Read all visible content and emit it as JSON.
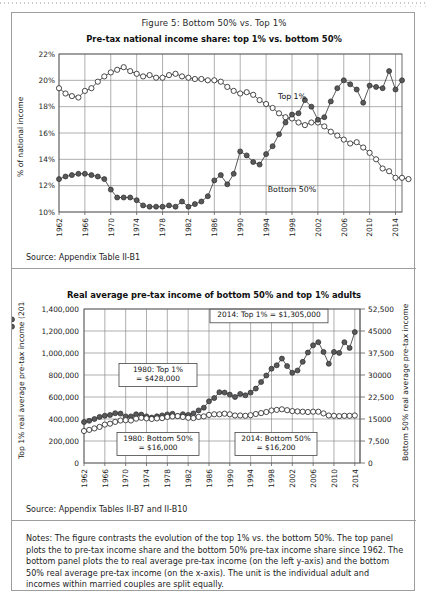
{
  "figure": {
    "caption": "Figure 5: Bottom 50% vs. Top 1%",
    "notes": "Notes: The figure contrasts the evolution of the top 1% vs. the bottom 50%. The top panel plots the to pre-tax income share and the bottom 50% pre-tax income share since 1962. The bottom panel plots the to real average pre-tax income (on the left y-axis) and the bottom 50% real average pre-tax income (on the x-axis). The unit is the individual adult and incomes within married couples are split equally."
  },
  "top_panel": {
    "source": "Source: Appendix Table II-B1"
  },
  "bottom_panel": {
    "source": "Source: Appendix Tables II-B7 and II-B10"
  },
  "chart_data": [
    {
      "type": "line",
      "title": "Pre-tax national income share: top 1% vs. bottom 50%",
      "xlabel": "",
      "ylabel": "% of national income",
      "ylim": [
        10,
        22
      ],
      "xlim": [
        1962,
        2015
      ],
      "yticks": [
        "10%",
        "12%",
        "14%",
        "16%",
        "18%",
        "20%",
        "22%"
      ],
      "ytick_values": [
        10,
        12,
        14,
        16,
        18,
        20,
        22
      ],
      "xticks": [
        1962,
        1966,
        1970,
        1974,
        1978,
        1982,
        1986,
        1990,
        1994,
        1998,
        2002,
        2006,
        2010,
        2014
      ],
      "grid": true,
      "legend": "inline-annotation",
      "x": [
        1962,
        1963,
        1964,
        1965,
        1966,
        1967,
        1968,
        1969,
        1970,
        1971,
        1972,
        1973,
        1974,
        1975,
        1976,
        1977,
        1978,
        1979,
        1980,
        1981,
        1982,
        1983,
        1984,
        1985,
        1986,
        1987,
        1988,
        1989,
        1990,
        1991,
        1992,
        1993,
        1994,
        1995,
        1996,
        1997,
        1998,
        1999,
        2000,
        2001,
        2002,
        2003,
        2004,
        2005,
        2006,
        2007,
        2008,
        2009,
        2010,
        2011,
        2012,
        2013,
        2014
      ],
      "series": [
        {
          "name": "Bottom 50%",
          "marker": "open-circle",
          "values": [
            19.4,
            19.0,
            18.8,
            18.7,
            19.2,
            19.4,
            19.9,
            20.3,
            20.6,
            20.8,
            21.0,
            20.7,
            20.5,
            20.3,
            20.4,
            20.2,
            20.2,
            20.4,
            20.5,
            20.3,
            20.2,
            20.1,
            20.1,
            20.0,
            20.0,
            19.9,
            19.5,
            19.2,
            19.0,
            19.1,
            18.9,
            18.5,
            18.2,
            17.9,
            17.5,
            17.2,
            17.1,
            16.8,
            16.6,
            16.8,
            16.8,
            16.5,
            16.1,
            15.8,
            15.5,
            15.2,
            15.3,
            14.9,
            14.5,
            14.0,
            13.3,
            13.1,
            12.6,
            12.6,
            12.5
          ]
        },
        {
          "name": "Top 1%",
          "marker": "filled-circle",
          "values": [
            12.5,
            12.7,
            12.8,
            12.9,
            12.9,
            12.8,
            12.7,
            12.5,
            11.7,
            11.1,
            11.1,
            11.1,
            10.9,
            10.5,
            10.4,
            10.4,
            10.4,
            10.5,
            10.4,
            10.8,
            10.4,
            10.6,
            10.8,
            11.2,
            12.4,
            12.8,
            12.1,
            12.9,
            14.6,
            14.3,
            13.8,
            13.6,
            14.4,
            15.0,
            15.9,
            16.8,
            17.4,
            17.5,
            18.5,
            18.0,
            17.0,
            17.2,
            18.4,
            19.4,
            20.0,
            19.7,
            19.3,
            18.3,
            19.6,
            19.5,
            19.4,
            20.7,
            19.3,
            20.0
          ]
        }
      ]
    },
    {
      "type": "line",
      "title": "Real average pre-tax income of bottom 50% and top 1% adults",
      "xlabel": "",
      "ylabel_left": "Top 1% real average pre-tax income (2014$)",
      "ylabel_right": "Bottom 50% real average pre-tax income (2014$)",
      "ylim_left": [
        0,
        1400000
      ],
      "ylim_right": [
        0,
        52500
      ],
      "yticks_left": [
        "0",
        "200,000",
        "400,000",
        "600,000",
        "800,000",
        "1,000,000",
        "1,200,000",
        "1,400,000"
      ],
      "ytick_values_left": [
        0,
        200000,
        400000,
        600000,
        800000,
        1000000,
        1200000,
        1400000
      ],
      "yticks_right": [
        "0",
        "7,500",
        "15000",
        "22,500",
        "30000",
        "37,500",
        "45000",
        "52,500"
      ],
      "ytick_values_right": [
        0,
        7500,
        15000,
        22500,
        30000,
        37500,
        45000,
        52500
      ],
      "xticks": [
        1962,
        1966,
        1970,
        1974,
        1978,
        1982,
        1986,
        1990,
        1994,
        1998,
        2002,
        2006,
        2010,
        2014
      ],
      "xlim": [
        1962,
        2015
      ],
      "grid": true,
      "annotations": [
        "2014: Top 1% = $1,305,000",
        "1980: Top 1% = $428,000",
        "1980: Bottom 50% = $16,000",
        "2014: Bottom 50% = $16,200"
      ],
      "x": [
        1962,
        1963,
        1964,
        1965,
        1966,
        1967,
        1968,
        1969,
        1970,
        1971,
        1972,
        1973,
        1974,
        1975,
        1976,
        1977,
        1978,
        1979,
        1980,
        1981,
        1982,
        1983,
        1984,
        1985,
        1986,
        1987,
        1988,
        1989,
        1990,
        1991,
        1992,
        1993,
        1994,
        1995,
        1996,
        1997,
        1998,
        1999,
        2000,
        2001,
        2002,
        2003,
        2004,
        2005,
        2006,
        2007,
        2008,
        2009,
        2010,
        2011,
        2012,
        2013,
        2014
      ],
      "series": [
        {
          "name": "Top 1%",
          "marker": "filled-circle",
          "axis": "left",
          "values": [
            373000,
            384000,
            400000,
            419000,
            430000,
            436000,
            453000,
            449000,
            424000,
            424000,
            443000,
            440000,
            424000,
            413000,
            425000,
            433000,
            442000,
            447000,
            428000,
            444000,
            437000,
            451000,
            478000,
            503000,
            561000,
            590000,
            644000,
            640000,
            622000,
            600000,
            628000,
            615000,
            640000,
            676000,
            736000,
            795000,
            857000,
            888000,
            949000,
            881000,
            820000,
            841000,
            920000,
            1005000,
            1070000,
            1098000,
            1010000,
            902000,
            1010000,
            1001000,
            1098000,
            1046000,
            1190000,
            1240000,
            1305000
          ]
        },
        {
          "name": "Bottom 50%",
          "marker": "open-circle",
          "axis": "right",
          "values": [
            10900,
            11300,
            11800,
            12300,
            13100,
            13400,
            14000,
            14500,
            14600,
            14500,
            15100,
            15400,
            15200,
            15000,
            15200,
            15300,
            15700,
            15900,
            16000,
            15700,
            15400,
            15300,
            15700,
            15900,
            16400,
            16600,
            16600,
            16800,
            16600,
            16200,
            16200,
            16100,
            16300,
            16700,
            17000,
            17400,
            17900,
            18100,
            18300,
            18000,
            17700,
            17600,
            17500,
            17400,
            17500,
            17500,
            16900,
            16200,
            16100,
            16000,
            16100,
            16100,
            16200
          ]
        }
      ]
    }
  ]
}
